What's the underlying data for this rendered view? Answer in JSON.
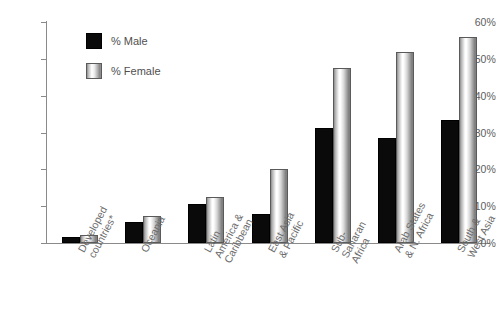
{
  "chart_data": {
    "type": "bar",
    "title": "",
    "subtitle": "",
    "xlabel": "",
    "ylabel": "",
    "ylim": [
      0,
      60
    ],
    "grid": false,
    "legend_position": "top-left",
    "y_ticks": [
      "0%",
      "10%",
      "20%",
      "30%",
      "40%",
      "50%",
      "60%"
    ],
    "y_tick_values": [
      0,
      10,
      20,
      30,
      40,
      50,
      60
    ],
    "categories": [
      "Developed\ncountries*",
      "Oceania",
      "Latin\nAmerica &\nCaribbean",
      "East Asia\n& Pacific",
      "Sub-\nSaharan\nAfrica",
      "Arab States\n& N. Africa",
      "South &\nWest Asia"
    ],
    "series": [
      {
        "name": "% Male",
        "color": "#0a0a0a",
        "values": [
          1.7,
          5.7,
          10.6,
          8.0,
          31.2,
          28.4,
          33.4
        ]
      },
      {
        "name": "% Female",
        "color": "#d9d9d9",
        "values": [
          2.2,
          7.3,
          12.5,
          20.0,
          47.5,
          51.8,
          56.0
        ]
      }
    ]
  },
  "legend": {
    "items": [
      {
        "label": "% Male"
      },
      {
        "label": "% Female"
      }
    ]
  }
}
